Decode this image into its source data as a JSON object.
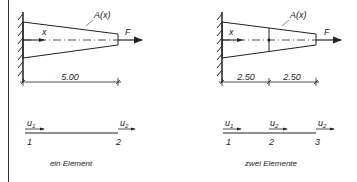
{
  "left_figure": {
    "area_label": "A(x)",
    "axis_label": "x",
    "force_label": "F",
    "dimension": "5.00",
    "nodes": [
      "1",
      "2"
    ],
    "dofs": [
      "u1",
      "u2"
    ],
    "dof_base": [
      "u",
      "u"
    ],
    "dof_sub": [
      "1",
      "2"
    ],
    "caption": "ein Element"
  },
  "right_figure": {
    "area_label": "A(x)",
    "axis_label": "x",
    "force_label": "F",
    "dimensions": [
      "2.50",
      "2.50"
    ],
    "nodes": [
      "1",
      "2",
      "3"
    ],
    "dof_base": [
      "u",
      "u",
      "u"
    ],
    "dof_sub": [
      "1",
      "2",
      "2"
    ],
    "caption": "zwei Elemente"
  },
  "colors": {
    "line": "#222222",
    "background": "#ffffff"
  }
}
